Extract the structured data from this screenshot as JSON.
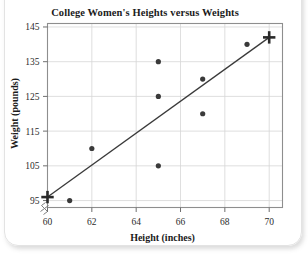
{
  "chart_data": {
    "type": "scatter",
    "title": "College Women's Heights versus Weights",
    "xlabel": "Height (inches)",
    "ylabel": "Weight (pounds)",
    "xlim": [
      60,
      70.6
    ],
    "ylim": [
      93,
      146
    ],
    "xticks": [
      60,
      62,
      64,
      66,
      68,
      70
    ],
    "yticks": [
      95,
      105,
      115,
      125,
      135,
      145
    ],
    "grid": true,
    "legend": "none",
    "axis_break": true,
    "series": [
      {
        "name": "data points",
        "marker": "circle",
        "color": "#3a3a3a",
        "points": [
          {
            "x": 61,
            "y": 95
          },
          {
            "x": 62,
            "y": 110
          },
          {
            "x": 65,
            "y": 105
          },
          {
            "x": 65,
            "y": 125
          },
          {
            "x": 65,
            "y": 135
          },
          {
            "x": 67,
            "y": 120
          },
          {
            "x": 67,
            "y": 130
          },
          {
            "x": 69,
            "y": 140
          }
        ]
      },
      {
        "name": "highlighted endpoints",
        "marker": "plus",
        "color": "#2a2a2a",
        "points": [
          {
            "x": 60,
            "y": 96
          },
          {
            "x": 70,
            "y": 142
          }
        ]
      }
    ],
    "trend_line": {
      "name": "fitted line",
      "color": "#3a3a3a",
      "from": {
        "x": 60,
        "y": 96
      },
      "to": {
        "x": 70,
        "y": 142
      }
    }
  },
  "axes": {
    "xtick_labels": [
      "60",
      "62",
      "64",
      "66",
      "68",
      "70"
    ],
    "ytick_labels": [
      "95",
      "105",
      "115",
      "125",
      "135",
      "145"
    ]
  }
}
